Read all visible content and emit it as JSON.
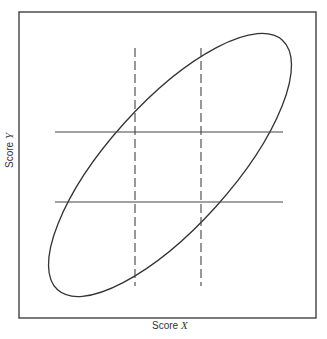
{
  "figure": {
    "type": "scatter-ellipse-diagram",
    "x_axis": {
      "prefix": "Score ",
      "variable": "X"
    },
    "y_axis": {
      "prefix": "Score ",
      "variable": "Y"
    },
    "frame": {
      "x": 19,
      "y": 12,
      "width": 297,
      "height": 306
    },
    "ellipse": {
      "cx": 170,
      "cy": 165,
      "rx": 168,
      "ry": 62,
      "rotation_deg": -48
    },
    "horizontal_lines": [
      {
        "y": 132,
        "x1": 55,
        "x2": 283,
        "style": "solid"
      },
      {
        "y": 202,
        "x1": 55,
        "x2": 283,
        "style": "solid"
      }
    ],
    "vertical_lines": [
      {
        "x": 135,
        "y1": 48,
        "y2": 286,
        "style": "dashed"
      },
      {
        "x": 201,
        "y1": 48,
        "y2": 286,
        "style": "dashed"
      }
    ],
    "colors": {
      "line": "#333333",
      "background": "#ffffff"
    }
  }
}
